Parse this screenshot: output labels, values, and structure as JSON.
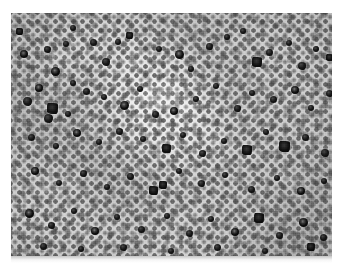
{
  "figure": {
    "kind": "histopathology-micrograph",
    "modality": "brightfield light microscopy",
    "stain_appearance": "grayscale immunohistochemistry-like, dark positive cells on pale counterstained background",
    "caption": ""
  },
  "plate": {
    "left_px": 11,
    "top_px": 13,
    "width_px": 321,
    "height_px": 243,
    "page_background": "#ffffff",
    "tissue_base_color": "#c2c2c2",
    "dark_cell_color": "#111111",
    "pale_region_color": "#e2e2e2"
  },
  "observations": {
    "background_cell_diameter_px": 5,
    "dark_cell_diameter_px_range": "6-11",
    "dark_cell_count_visible": 78,
    "pale_clearing_zones": 6,
    "densest_region": "left and lower-left",
    "palest_region": "center"
  },
  "pale_streaks": [
    {
      "left": 120,
      "top": 72,
      "w": 52,
      "h": 16,
      "rot": -22,
      "op": 0.4
    },
    {
      "left": 141,
      "top": 88,
      "w": 44,
      "h": 13,
      "rot": 12,
      "op": 0.45
    },
    {
      "left": 96,
      "top": 48,
      "w": 40,
      "h": 11,
      "rot": -38,
      "op": 0.32
    },
    {
      "left": 30,
      "top": 40,
      "w": 34,
      "h": 10,
      "rot": 20,
      "op": 0.3
    },
    {
      "left": 24,
      "top": 166,
      "w": 44,
      "h": 12,
      "rot": -14,
      "op": 0.34
    },
    {
      "left": 188,
      "top": 120,
      "w": 38,
      "h": 11,
      "rot": 28,
      "op": 0.3
    },
    {
      "left": 236,
      "top": 58,
      "w": 34,
      "h": 10,
      "rot": -18,
      "op": 0.26
    },
    {
      "left": 260,
      "top": 160,
      "w": 40,
      "h": 12,
      "rot": 16,
      "op": 0.28
    },
    {
      "left": 160,
      "top": 196,
      "w": 36,
      "h": 10,
      "rot": -26,
      "op": 0.26
    },
    {
      "left": 64,
      "top": 112,
      "w": 30,
      "h": 9,
      "rot": 40,
      "op": 0.24
    },
    {
      "left": 204,
      "top": 28,
      "w": 30,
      "h": 9,
      "rot": -10,
      "op": 0.24
    },
    {
      "left": 92,
      "top": 212,
      "w": 32,
      "h": 9,
      "rot": 22,
      "op": 0.22
    }
  ],
  "dark_cells": [
    {
      "x": 13,
      "y": 41,
      "d": 8,
      "k": "ring"
    },
    {
      "x": 36,
      "y": 36,
      "d": 7,
      "k": "irregular"
    },
    {
      "x": 55,
      "y": 31,
      "d": 6,
      "k": "plain"
    },
    {
      "x": 44,
      "y": 58,
      "d": 9,
      "k": "ring"
    },
    {
      "x": 82,
      "y": 29,
      "d": 7,
      "k": "plain"
    },
    {
      "x": 95,
      "y": 49,
      "d": 8,
      "k": "irregular"
    },
    {
      "x": 107,
      "y": 29,
      "d": 6,
      "k": "plain"
    },
    {
      "x": 118,
      "y": 22,
      "d": 7,
      "k": "angular"
    },
    {
      "x": 148,
      "y": 36,
      "d": 6,
      "k": "plain"
    },
    {
      "x": 168,
      "y": 41,
      "d": 9,
      "k": "ring"
    },
    {
      "x": 180,
      "y": 56,
      "d": 6,
      "k": "plain"
    },
    {
      "x": 198,
      "y": 33,
      "d": 7,
      "k": "irregular"
    },
    {
      "x": 216,
      "y": 24,
      "d": 6,
      "k": "plain"
    },
    {
      "x": 246,
      "y": 49,
      "d": 10,
      "k": "angular"
    },
    {
      "x": 258,
      "y": 39,
      "d": 7,
      "k": "plain"
    },
    {
      "x": 278,
      "y": 30,
      "d": 6,
      "k": "plain"
    },
    {
      "x": 291,
      "y": 53,
      "d": 8,
      "k": "irregular"
    },
    {
      "x": 305,
      "y": 36,
      "d": 6,
      "k": "plain"
    },
    {
      "x": 318,
      "y": 44,
      "d": 7,
      "k": "angular"
    },
    {
      "x": 28,
      "y": 75,
      "d": 8,
      "k": "ring"
    },
    {
      "x": 16,
      "y": 88,
      "d": 9,
      "k": "irregular"
    },
    {
      "x": 41,
      "y": 95,
      "d": 11,
      "k": "angular"
    },
    {
      "x": 37,
      "y": 105,
      "d": 9,
      "k": "irregular"
    },
    {
      "x": 57,
      "y": 101,
      "d": 6,
      "k": "plain"
    },
    {
      "x": 75,
      "y": 78,
      "d": 7,
      "k": "plain"
    },
    {
      "x": 62,
      "y": 70,
      "d": 6,
      "k": "plain"
    },
    {
      "x": 93,
      "y": 84,
      "d": 6,
      "k": "plain"
    },
    {
      "x": 113,
      "y": 92,
      "d": 9,
      "k": "ring"
    },
    {
      "x": 129,
      "y": 76,
      "d": 6,
      "k": "plain"
    },
    {
      "x": 144,
      "y": 101,
      "d": 7,
      "k": "irregular"
    },
    {
      "x": 163,
      "y": 98,
      "d": 8,
      "k": "ring"
    },
    {
      "x": 185,
      "y": 86,
      "d": 6,
      "k": "plain"
    },
    {
      "x": 205,
      "y": 73,
      "d": 6,
      "k": "plain"
    },
    {
      "x": 226,
      "y": 95,
      "d": 7,
      "k": "irregular"
    },
    {
      "x": 241,
      "y": 80,
      "d": 6,
      "k": "plain"
    },
    {
      "x": 262,
      "y": 86,
      "d": 7,
      "k": "plain"
    },
    {
      "x": 284,
      "y": 77,
      "d": 8,
      "k": "ring"
    },
    {
      "x": 300,
      "y": 95,
      "d": 6,
      "k": "plain"
    },
    {
      "x": 318,
      "y": 80,
      "d": 7,
      "k": "irregular"
    },
    {
      "x": 20,
      "y": 124,
      "d": 7,
      "k": "plain"
    },
    {
      "x": 45,
      "y": 133,
      "d": 6,
      "k": "plain"
    },
    {
      "x": 66,
      "y": 120,
      "d": 8,
      "k": "ring"
    },
    {
      "x": 88,
      "y": 129,
      "d": 6,
      "k": "plain"
    },
    {
      "x": 108,
      "y": 118,
      "d": 7,
      "k": "irregular"
    },
    {
      "x": 132,
      "y": 126,
      "d": 6,
      "k": "plain"
    },
    {
      "x": 155,
      "y": 135,
      "d": 9,
      "k": "angular"
    },
    {
      "x": 172,
      "y": 122,
      "d": 6,
      "k": "plain"
    },
    {
      "x": 191,
      "y": 140,
      "d": 7,
      "k": "irregular"
    },
    {
      "x": 213,
      "y": 128,
      "d": 6,
      "k": "plain"
    },
    {
      "x": 236,
      "y": 137,
      "d": 10,
      "k": "angular"
    },
    {
      "x": 255,
      "y": 119,
      "d": 6,
      "k": "plain"
    },
    {
      "x": 273,
      "y": 133,
      "d": 11,
      "k": "angular"
    },
    {
      "x": 294,
      "y": 124,
      "d": 7,
      "k": "plain"
    },
    {
      "x": 314,
      "y": 140,
      "d": 8,
      "k": "irregular"
    },
    {
      "x": 24,
      "y": 158,
      "d": 8,
      "k": "ring"
    },
    {
      "x": 48,
      "y": 170,
      "d": 6,
      "k": "plain"
    },
    {
      "x": 72,
      "y": 160,
      "d": 7,
      "k": "irregular"
    },
    {
      "x": 96,
      "y": 174,
      "d": 6,
      "k": "plain"
    },
    {
      "x": 119,
      "y": 163,
      "d": 7,
      "k": "plain"
    },
    {
      "x": 142,
      "y": 177,
      "d": 9,
      "k": "angular"
    },
    {
      "x": 152,
      "y": 172,
      "d": 8,
      "k": "angular"
    },
    {
      "x": 168,
      "y": 158,
      "d": 6,
      "k": "plain"
    },
    {
      "x": 190,
      "y": 170,
      "d": 7,
      "k": "irregular"
    },
    {
      "x": 214,
      "y": 162,
      "d": 6,
      "k": "plain"
    },
    {
      "x": 240,
      "y": 176,
      "d": 7,
      "k": "plain"
    },
    {
      "x": 266,
      "y": 165,
      "d": 6,
      "k": "plain"
    },
    {
      "x": 290,
      "y": 178,
      "d": 8,
      "k": "ring"
    },
    {
      "x": 313,
      "y": 168,
      "d": 6,
      "k": "plain"
    },
    {
      "x": 18,
      "y": 200,
      "d": 9,
      "k": "ring"
    },
    {
      "x": 40,
      "y": 212,
      "d": 7,
      "k": "irregular"
    },
    {
      "x": 63,
      "y": 198,
      "d": 6,
      "k": "plain"
    },
    {
      "x": 84,
      "y": 218,
      "d": 8,
      "k": "ring"
    },
    {
      "x": 106,
      "y": 204,
      "d": 6,
      "k": "plain"
    },
    {
      "x": 130,
      "y": 216,
      "d": 7,
      "k": "plain"
    },
    {
      "x": 156,
      "y": 203,
      "d": 6,
      "k": "plain"
    },
    {
      "x": 178,
      "y": 220,
      "d": 7,
      "k": "irregular"
    },
    {
      "x": 200,
      "y": 206,
      "d": 6,
      "k": "plain"
    },
    {
      "x": 224,
      "y": 219,
      "d": 8,
      "k": "ring"
    },
    {
      "x": 248,
      "y": 205,
      "d": 10,
      "k": "angular"
    },
    {
      "x": 268,
      "y": 222,
      "d": 7,
      "k": "irregular"
    },
    {
      "x": 292,
      "y": 209,
      "d": 9,
      "k": "ring"
    },
    {
      "x": 312,
      "y": 224,
      "d": 7,
      "k": "plain"
    },
    {
      "x": 32,
      "y": 233,
      "d": 7,
      "k": "plain"
    },
    {
      "x": 70,
      "y": 236,
      "d": 6,
      "k": "plain"
    },
    {
      "x": 112,
      "y": 234,
      "d": 7,
      "k": "irregular"
    },
    {
      "x": 160,
      "y": 238,
      "d": 6,
      "k": "plain"
    },
    {
      "x": 206,
      "y": 234,
      "d": 7,
      "k": "plain"
    },
    {
      "x": 254,
      "y": 238,
      "d": 6,
      "k": "plain"
    },
    {
      "x": 300,
      "y": 234,
      "d": 8,
      "k": "angular"
    },
    {
      "x": 8,
      "y": 18,
      "d": 7,
      "k": "angular"
    },
    {
      "x": 62,
      "y": 15,
      "d": 6,
      "k": "plain"
    },
    {
      "x": 232,
      "y": 18,
      "d": 6,
      "k": "plain"
    }
  ]
}
